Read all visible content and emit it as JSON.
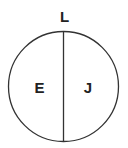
{
  "diagram": {
    "top_label": "L",
    "left_label": "E",
    "right_label": "J",
    "stroke_color": "#333333",
    "text_color": "#222222"
  }
}
